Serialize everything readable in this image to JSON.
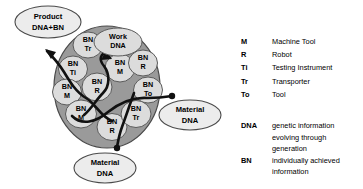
{
  "colors": {
    "page_background": "#ffffff",
    "organism_fill": "#9a9a9a",
    "organism_stroke": "#4a4a4a",
    "cell_fill": "#dcdcdc",
    "cell_stroke": "#5a5a5a",
    "external_fill": "#ececec",
    "external_stroke": "#4a4a4a",
    "flow_stroke": "#111111",
    "text": "#000000"
  },
  "organism": {
    "label": "manufacturing-organism-circle",
    "cells": [
      {
        "id": "cell-bn-tr-top",
        "line1": "BN",
        "line2": "Tr",
        "cx": 88,
        "cy": 45,
        "rx": 15,
        "ry": 13
      },
      {
        "id": "cell-bn-ti",
        "line1": "BN",
        "line2": "Ti",
        "cx": 73,
        "cy": 69,
        "rx": 14.5,
        "ry": 13
      },
      {
        "id": "cell-bn-m-left",
        "line1": "BN",
        "line2": "M",
        "cx": 67,
        "cy": 92,
        "rx": 14.5,
        "ry": 13
      },
      {
        "id": "cell-bn-r-center",
        "line1": "BN",
        "line2": "R",
        "cx": 97,
        "cy": 87,
        "rx": 15,
        "ry": 14
      },
      {
        "id": "cell-bn-m-mid",
        "line1": "BN",
        "line2": "M",
        "cx": 120,
        "cy": 68,
        "rx": 15,
        "ry": 14
      },
      {
        "id": "cell-bn-r-right",
        "line1": "BN",
        "line2": "R",
        "cx": 143,
        "cy": 63,
        "rx": 14.5,
        "ry": 13
      },
      {
        "id": "cell-bn-to",
        "line1": "BN",
        "line2": "To",
        "cx": 148,
        "cy": 90,
        "rx": 14.5,
        "ry": 13
      },
      {
        "id": "cell-bn-m-lower",
        "line1": "BN",
        "line2": "M",
        "cx": 81,
        "cy": 114,
        "rx": 15.5,
        "ry": 14
      },
      {
        "id": "cell-bn-r-bottom",
        "line1": "BN",
        "line2": "R",
        "cx": 112,
        "cy": 127,
        "rx": 15,
        "ry": 13.5
      },
      {
        "id": "cell-bn-tr-lower",
        "line1": "BN",
        "line2": "Tr",
        "cx": 136,
        "cy": 114,
        "rx": 15,
        "ry": 13.5
      }
    ],
    "work_dna": {
      "id": "cell-work-dna",
      "line1": "Work",
      "line2": "DNA",
      "cx": 118,
      "cy": 42,
      "rx": 24,
      "ry": 14
    }
  },
  "external_nodes": [
    {
      "id": "product-dna-bn",
      "line1": "Product",
      "line2": "DNA+BN",
      "cx": 48,
      "cy": 22,
      "rx": 33,
      "ry": 16
    },
    {
      "id": "material-dna-right",
      "line1": "Material",
      "line2": "DNA",
      "cx": 190,
      "cy": 115,
      "rx": 31,
      "ry": 15
    },
    {
      "id": "material-dna-bottom",
      "line1": "Material",
      "line2": "DNA",
      "cx": 105,
      "cy": 168,
      "rx": 31,
      "ry": 15
    }
  ],
  "legend_abbreviations": {
    "title": "abbreviation-legend",
    "rows": [
      {
        "abbr": "M",
        "meaning": "Machine Tool"
      },
      {
        "abbr": "R",
        "meaning": "Robot"
      },
      {
        "abbr": "Ti",
        "meaning": "Testing Instrument"
      },
      {
        "abbr": "Tr",
        "meaning": "Transporter"
      },
      {
        "abbr": "To",
        "meaning": "Tool"
      }
    ]
  },
  "legend_definitions": {
    "title": "definition-legend",
    "rows": [
      {
        "abbr": "DNA",
        "lines": [
          "genetic information",
          "evolving through",
          "generation"
        ]
      },
      {
        "abbr": "BN",
        "lines": [
          "individually achieved",
          "information"
        ]
      }
    ]
  }
}
